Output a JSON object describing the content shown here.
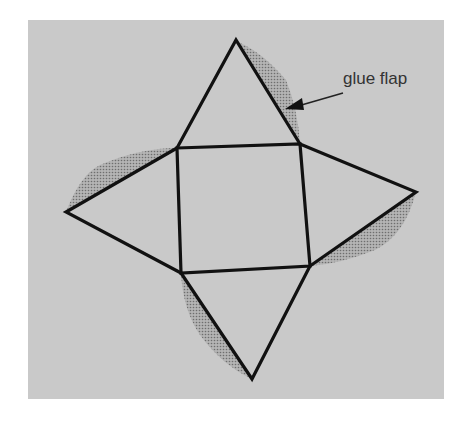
{
  "diagram": {
    "type": "pyramid-net",
    "annotation": {
      "label": "glue flap",
      "points_to": "glue flap on top triangle right edge"
    },
    "colors": {
      "background": "#ffffff",
      "panel": "#c9c9c9",
      "outline": "#111111",
      "flap": "#9a9a9a",
      "label": "#333333"
    },
    "faces": {
      "square": [
        [
          177,
          148
        ],
        [
          300,
          144
        ],
        [
          310,
          266
        ],
        [
          181,
          273
        ]
      ],
      "top_apex": [
        236,
        40
      ],
      "left_apex": [
        66,
        212
      ],
      "right_apex": [
        416,
        192
      ],
      "bottom_apex": [
        252,
        379
      ]
    },
    "flap_count": 4
  }
}
